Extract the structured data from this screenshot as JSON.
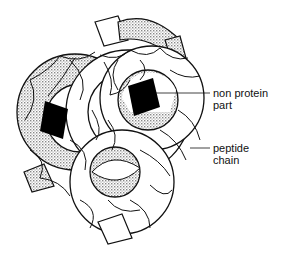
{
  "diagram": {
    "title": "",
    "labels": [
      {
        "id": "non-protein",
        "lines": [
          "non protein",
          "part"
        ]
      },
      {
        "id": "peptide",
        "lines": [
          "peptide",
          "chain"
        ]
      }
    ],
    "colors": {
      "ink": "#111111",
      "stipple": "#bdbdbd",
      "background": "#ffffff"
    }
  }
}
